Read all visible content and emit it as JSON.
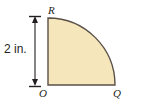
{
  "figure": {
    "kind": "geometry-diagram",
    "background_color": "#ffffff",
    "shape": {
      "name": "quarter-circle-sector",
      "fill_color": "#f5e7bb",
      "stroke_color": "#5a5048",
      "stroke_width": 1.4,
      "center_label": "O",
      "radius_in": 2
    },
    "vertex_labels": {
      "top": "R",
      "origin": "O",
      "right": "Q"
    },
    "dimension": {
      "label": "2 in.",
      "value": 2,
      "unit": "in.",
      "orientation": "vertical",
      "from_label": "O",
      "to_label": "R",
      "line_color": "#231f20",
      "arrow_style": "double-headed-with-ticks"
    }
  }
}
